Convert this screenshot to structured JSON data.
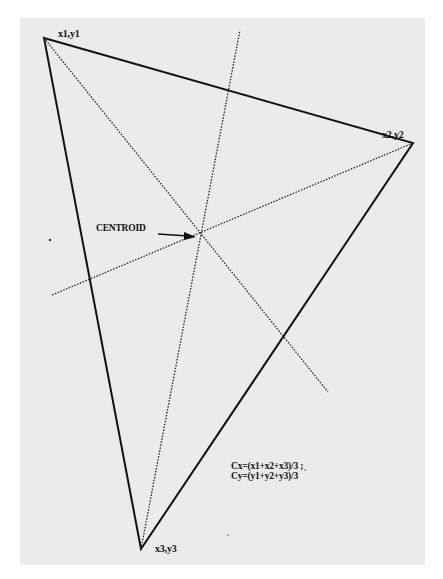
{
  "diagram": {
    "vertices": [
      {
        "label": "x1,y1",
        "x": 44,
        "y": 38
      },
      {
        "label": "x2,y2",
        "x": 413,
        "y": 143
      },
      {
        "label": "x3,y3",
        "x": 141,
        "y": 549
      }
    ],
    "centroid": {
      "label": "CENTROID",
      "x": 199,
      "y": 243
    },
    "medians": [
      {
        "from": "x1,y1",
        "to_end": [
          328,
          392
        ]
      },
      {
        "from": "x2,y2",
        "to_end": [
          52,
          295
        ]
      },
      {
        "from": "x3,y3",
        "to_end": [
          240,
          30
        ]
      }
    ],
    "formula": {
      "line1": "Cx=(x1+x2+x3)/3 ;",
      "line2": "Cy=(y1+y2+y3)/3"
    },
    "colors": {
      "paper": "#ebebeb",
      "ink": "#111111"
    }
  }
}
